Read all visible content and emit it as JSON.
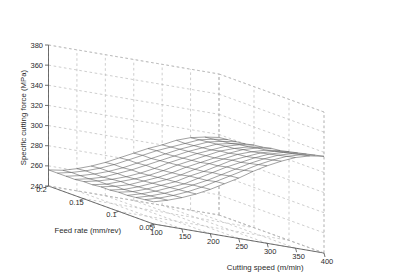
{
  "chart_data": {
    "type": "surface",
    "title": "",
    "xlabel": "Cutting speed (m/min)",
    "ylabel": "Feed rate (mm/rev)",
    "zlabel": "Specific cutting force (MPa)",
    "xlim": [
      100,
      400
    ],
    "ylim": [
      0.05,
      0.2
    ],
    "zlim": [
      240,
      380
    ],
    "xticks": [
      100,
      150,
      200,
      250,
      300,
      350,
      400
    ],
    "yticks": [
      0.05,
      0.1,
      0.15,
      0.2
    ],
    "zticks": [
      240,
      260,
      280,
      300,
      320,
      340,
      360,
      380
    ],
    "xticklabels": [
      "100",
      "150",
      "200",
      "250",
      "300",
      "350",
      "400"
    ],
    "yticklabels": [
      "0.05",
      "0.1",
      "0.15",
      "0.2"
    ],
    "zticklabels": [
      "240",
      "260",
      "280",
      "300",
      "320",
      "340",
      "360",
      "380"
    ],
    "grid": true,
    "legend": false,
    "mesh_style": "wireframe",
    "mesh_color": "#555555",
    "grid_color": "#b9b9b9",
    "axis_color": "#4d4d4d",
    "view": {
      "azimuth": -37.5,
      "elevation": 18
    },
    "grid_nx": 13,
    "grid_ny": 13,
    "x": [
      100,
      125,
      150,
      175,
      200,
      225,
      250,
      275,
      300,
      325,
      350,
      375,
      400
    ],
    "y": [
      0.05,
      0.0625,
      0.075,
      0.0875,
      0.1,
      0.1125,
      0.125,
      0.1375,
      0.15,
      0.1625,
      0.175,
      0.1875,
      0.2
    ],
    "z_rows_note": "rows correspond to y (feed rate) ascending, columns to x (cutting speed) ascending",
    "z": [
      [
        262,
        266,
        271,
        277,
        284,
        292,
        300,
        309,
        317,
        324,
        330,
        334,
        336
      ],
      [
        261,
        265,
        270,
        276,
        283,
        291,
        299,
        307,
        315,
        322,
        328,
        332,
        334
      ],
      [
        260,
        264,
        269,
        275,
        282,
        289,
        297,
        305,
        313,
        320,
        326,
        330,
        332
      ],
      [
        259,
        263,
        268,
        274,
        280,
        288,
        296,
        304,
        311,
        318,
        324,
        328,
        330
      ],
      [
        259,
        262,
        267,
        273,
        279,
        287,
        294,
        302,
        310,
        316,
        322,
        326,
        328
      ],
      [
        258,
        261,
        266,
        272,
        278,
        285,
        293,
        301,
        308,
        315,
        320,
        324,
        326
      ],
      [
        258,
        261,
        265,
        271,
        277,
        284,
        292,
        299,
        306,
        313,
        319,
        323,
        325
      ],
      [
        257,
        260,
        265,
        270,
        276,
        283,
        291,
        298,
        305,
        312,
        317,
        321,
        323
      ],
      [
        257,
        260,
        264,
        269,
        275,
        282,
        290,
        297,
        304,
        310,
        316,
        320,
        322
      ],
      [
        256,
        259,
        263,
        269,
        275,
        282,
        289,
        296,
        303,
        309,
        315,
        318,
        320
      ],
      [
        256,
        259,
        263,
        268,
        274,
        281,
        288,
        295,
        302,
        308,
        314,
        317,
        319
      ],
      [
        256,
        259,
        263,
        268,
        274,
        281,
        288,
        295,
        301,
        307,
        313,
        316,
        318
      ],
      [
        256,
        258,
        262,
        267,
        273,
        280,
        287,
        294,
        300,
        307,
        312,
        315,
        317
      ]
    ]
  }
}
